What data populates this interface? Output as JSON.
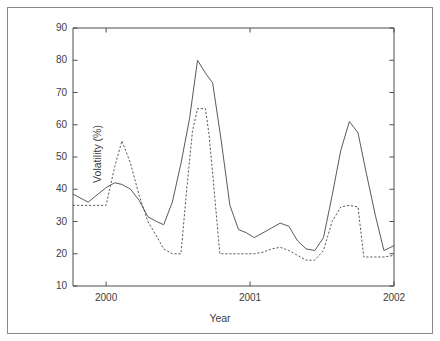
{
  "chart_data": {
    "type": "line",
    "title": "",
    "xlabel": "Year",
    "ylabel": "Volatility (%)",
    "xlim": [
      1999.77,
      2002.0
    ],
    "ylim": [
      10,
      90
    ],
    "xticks": [
      2000,
      2001,
      2002
    ],
    "xtick_labels": [
      "2000",
      "2001",
      "2002"
    ],
    "yticks": [
      10,
      20,
      30,
      40,
      50,
      60,
      70,
      80,
      90
    ],
    "ytick_labels": [
      "10",
      "20",
      "30",
      "40",
      "50",
      "60",
      "70",
      "80",
      "90"
    ],
    "grid": false,
    "legend": "none",
    "series": [
      {
        "name": "solid-series",
        "style": "solid",
        "color": "#5a5a5a",
        "x": [
          1999.77,
          1999.875,
          1999.93,
          2000.0,
          2000.06,
          2000.11,
          2000.17,
          2000.23,
          2000.29,
          2000.35,
          2000.4,
          2000.46,
          2000.52,
          2000.58,
          2000.635,
          2000.69,
          2000.74,
          2000.8,
          2000.86,
          2000.92,
          2000.975,
          2001.03,
          2001.09,
          2001.15,
          2001.21,
          2001.27,
          2001.33,
          2001.39,
          2001.45,
          2001.51,
          2001.57,
          2001.63,
          2001.69,
          2001.75,
          2001.81,
          2001.87,
          2001.93,
          2002.0
        ],
        "y": [
          38.5,
          36.0,
          38.0,
          40.5,
          42.0,
          41.5,
          40.0,
          36.5,
          31.5,
          30.0,
          29.0,
          36.0,
          48.0,
          62.0,
          80.0,
          76.0,
          73.0,
          55.0,
          35.0,
          27.5,
          26.5,
          25.0,
          26.5,
          28.0,
          29.5,
          28.5,
          24.0,
          21.5,
          21.0,
          25.0,
          38.0,
          52.0,
          61.0,
          57.5,
          44.5,
          32.0,
          21.0,
          22.5
        ]
      },
      {
        "name": "dashed-series",
        "style": "dashed",
        "color": "#5a5a5a",
        "x": [
          1999.77,
          1999.875,
          1999.93,
          2000.0,
          2000.06,
          2000.11,
          2000.17,
          2000.23,
          2000.29,
          2000.35,
          2000.4,
          2000.46,
          2000.52,
          2000.56,
          2000.6,
          2000.635,
          2000.69,
          2000.715,
          2000.74,
          2000.79,
          2000.86,
          2000.92,
          2000.975,
          2001.03,
          2001.09,
          2001.15,
          2001.21,
          2001.27,
          2001.33,
          2001.39,
          2001.45,
          2001.51,
          2001.57,
          2001.63,
          2001.69,
          2001.75,
          2001.79,
          2001.87,
          2001.93,
          2002.0
        ],
        "y": [
          35.0,
          35.0,
          35.0,
          35.0,
          47.0,
          55.0,
          48.0,
          38.0,
          30.0,
          25.5,
          21.5,
          20.0,
          20.0,
          40.0,
          58.0,
          65.0,
          65.0,
          57.0,
          45.0,
          20.0,
          20.0,
          20.0,
          20.0,
          20.0,
          20.5,
          21.5,
          22.0,
          21.0,
          19.5,
          18.0,
          18.0,
          21.0,
          30.0,
          34.5,
          35.0,
          34.5,
          19.0,
          19.0,
          19.0,
          19.5
        ]
      }
    ]
  },
  "axes": {
    "y_axis_title": "Volatility (%)",
    "x_axis_title": "Year"
  }
}
